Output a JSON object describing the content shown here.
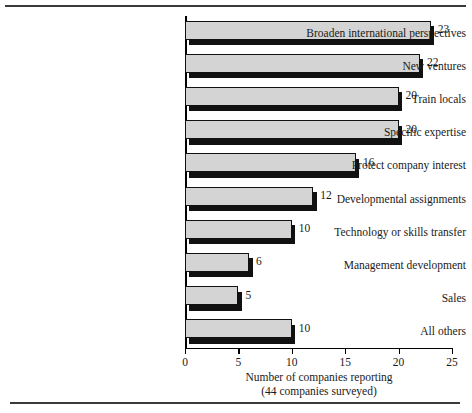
{
  "chart_data": {
    "type": "bar",
    "orientation": "horizontal",
    "title": "",
    "subtitle": "",
    "xlabel": "Number of companies reporting",
    "xlabel_line2": "(44 companies surveyed)",
    "ylabel": "",
    "xlim": [
      0,
      25
    ],
    "xticks": [
      0,
      5,
      10,
      15,
      20,
      25
    ],
    "xtick_labels": [
      "0",
      "5",
      "10",
      "15",
      "20",
      "25"
    ],
    "grid": false,
    "legend": false,
    "bar_fill_color": "#d4d4d4",
    "bar_edge_color": "#111111",
    "bar_shadow_color": "#111111",
    "categories": [
      "Broaden international perspectives",
      "New ventures",
      "Train locals",
      "Specific expertise",
      "Protect company interest",
      "Developmental assignments",
      "Technology or skills transfer",
      "Management development",
      "Sales",
      "All others"
    ],
    "values": [
      23,
      22,
      20,
      20,
      16,
      12,
      10,
      6,
      5,
      10
    ],
    "value_labels": [
      "23",
      "22",
      "20",
      "20",
      "16",
      "12",
      "10",
      "6",
      "5",
      "10"
    ]
  },
  "figure": {
    "top_rule": "",
    "bottom_rule": ""
  }
}
